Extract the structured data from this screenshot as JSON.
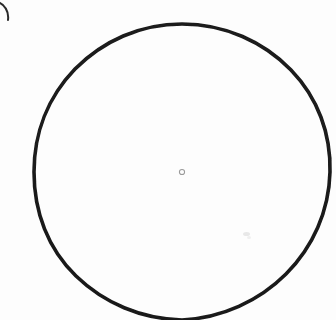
{
  "figure": {
    "caption_fragment": ")",
    "alt_text": "Large hand-drawn circle with a small hollow dot marking its center",
    "background_color": "#fdfdfd",
    "ink_color": "#1a1a1a",
    "center_marker_color": "#9a9a9a"
  },
  "chart_data": {
    "type": "scatter",
    "title": "",
    "subtitle": "",
    "xlabel": "",
    "ylabel": "",
    "xlim": [
      0,
      336
    ],
    "ylim": [
      0,
      320
    ],
    "grid": false,
    "legend": "none",
    "annotations": [
      {
        "name": "figure-label-fragment",
        "text": ")",
        "x": 4,
        "y": 10,
        "note": "closing parenthesis of a figure label, clipped at the left image edge"
      }
    ],
    "shapes": [
      {
        "name": "outer-circle",
        "kind": "circle",
        "cx": 182,
        "cy": 172,
        "r": 148,
        "stroke": "#1a1a1a",
        "stroke_width": 3.6,
        "fill": "none",
        "clipped": "bottom edge of image"
      },
      {
        "name": "center-marker",
        "kind": "circle",
        "cx": 182,
        "cy": 172,
        "r": 2.6,
        "stroke": "#9a9a9a",
        "stroke_width": 1.0,
        "fill": "none"
      }
    ],
    "series": [
      {
        "name": "center-point",
        "x": [
          182
        ],
        "y": [
          172
        ]
      }
    ]
  },
  "measurements": {
    "circle_center_x": 182,
    "circle_center_y": 172,
    "circle_radius": 148,
    "circle_stroke_width": 3.6,
    "center_marker_radius": 2.6,
    "image_width": 336,
    "image_height": 320
  }
}
